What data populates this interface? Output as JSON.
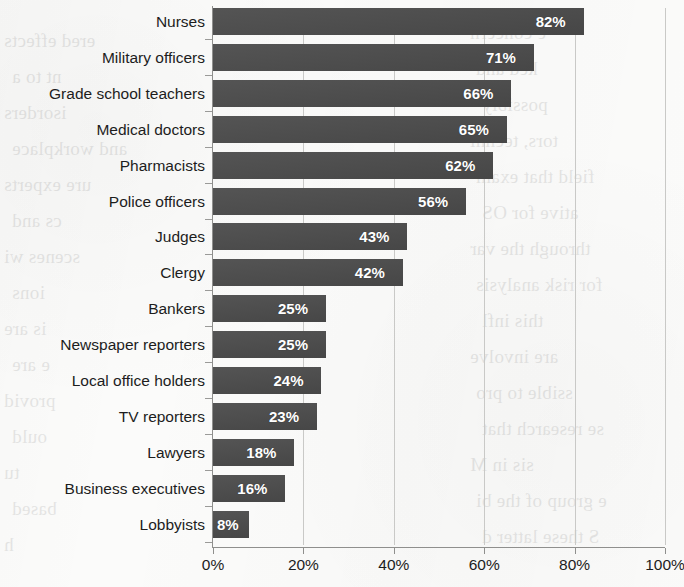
{
  "chart_data": {
    "type": "bar",
    "orientation": "horizontal",
    "title": "",
    "subtitle": "",
    "xlabel": "",
    "ylabel": "",
    "xlim": [
      0,
      100
    ],
    "grid": true,
    "legend": null,
    "bar_color": "#4b4b4b",
    "value_label_color": "#ffffff",
    "value_suffix": "%",
    "xtick_labels": [
      "0%",
      "20%",
      "40%",
      "60%",
      "80%",
      "100%"
    ],
    "xtick_values": [
      0,
      20,
      40,
      60,
      80,
      100
    ],
    "categories": [
      "Nurses",
      "Military officers",
      "Grade school teachers",
      "Medical doctors",
      "Pharmacists",
      "Police officers",
      "Judges",
      "Clergy",
      "Bankers",
      "Newspaper reporters",
      "Local office holders",
      "TV reporters",
      "Lawyers",
      "Business executives",
      "Lobbyists"
    ],
    "values": [
      82,
      71,
      66,
      65,
      62,
      56,
      43,
      42,
      25,
      25,
      24,
      23,
      18,
      16,
      8
    ],
    "value_labels": [
      "82%",
      "71%",
      "66%",
      "65%",
      "62%",
      "56%",
      "43%",
      "42%",
      "25%",
      "25%",
      "24%",
      "23%",
      "18%",
      "16%",
      "8%"
    ]
  },
  "background_text": {
    "right_column": [
      "e concern",
      "ked and",
      "possibly",
      "tors, techni",
      "field that exam",
      "ative for OS",
      "through the var",
      "for risk analysis",
      "this infl",
      "are involve",
      "ssible to pro",
      "se research that",
      "sis in M",
      "e group of the bi",
      "S these latter d"
    ],
    "left_column": [
      "ered effects",
      "nt to a",
      "isorders",
      "and workplace",
      "ure experts",
      "cs and",
      "scenes wi",
      "ions",
      "is are",
      "e are",
      "provid",
      "ould",
      "tu",
      "based",
      "h"
    ]
  }
}
